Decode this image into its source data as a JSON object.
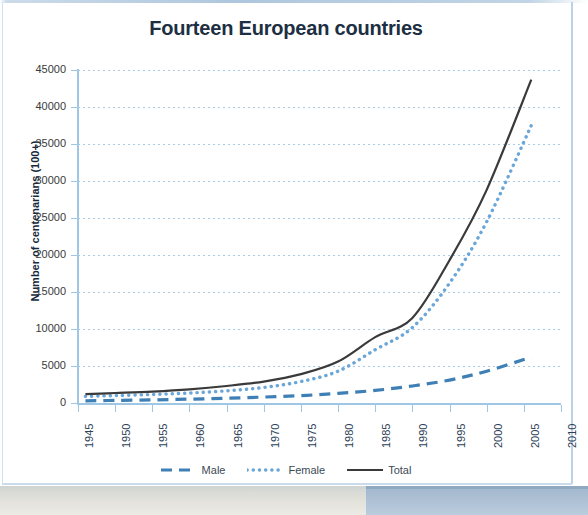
{
  "chart_title": "Fourteen European countries",
  "legend": {
    "items": [
      {
        "label": "Male",
        "key": "male",
        "style": "dashed",
        "color": "#3e7fb5"
      },
      {
        "label": "Female",
        "key": "female",
        "style": "dotted",
        "color": "#6aa6d8"
      },
      {
        "label": "Total",
        "key": "total",
        "style": "solid",
        "color": "#3a3a3a"
      }
    ]
  },
  "colors": {
    "title": "#1d2f42",
    "axis": "#9ec7e6",
    "gridline": "#a9cbe6",
    "male": "#3e7fb5",
    "female": "#6aa6d8",
    "total": "#3a3a3a",
    "page_background": "#ffffff",
    "strip_left": "#e3e2dc",
    "strip_right": "#aabfd4"
  },
  "chart_data": {
    "type": "line",
    "title": "Fourteen European countries",
    "xlabel": "",
    "ylabel": "Number of centenarians (100+)",
    "xlim": [
      1945,
      2010
    ],
    "ylim": [
      0,
      45000
    ],
    "xticks": [
      1945,
      1950,
      1955,
      1960,
      1965,
      1970,
      1975,
      1980,
      1985,
      1990,
      1995,
      2000,
      2005,
      2010
    ],
    "yticks": [
      0,
      5000,
      10000,
      15000,
      20000,
      25000,
      30000,
      35000,
      40000,
      45000
    ],
    "grid": "horizontal-dotted",
    "legend_position": "bottom",
    "x": [
      1946,
      1950,
      1955,
      1960,
      1965,
      1970,
      1975,
      1980,
      1985,
      1990,
      1995,
      2000,
      2006
    ],
    "series": [
      {
        "name": "Male",
        "style": "dashed",
        "color": "#3e7fb5",
        "values": [
          300,
          350,
          420,
          520,
          650,
          800,
          1000,
          1300,
          1700,
          2300,
          3100,
          4300,
          6200
        ]
      },
      {
        "name": "Female",
        "style": "dotted",
        "color": "#6aa6d8",
        "values": [
          900,
          1000,
          1150,
          1350,
          1650,
          2100,
          2900,
          4300,
          7200,
          10200,
          16200,
          24500,
          37500
        ]
      },
      {
        "name": "Total",
        "style": "solid",
        "color": "#3a3a3a",
        "values": [
          1200,
          1350,
          1550,
          1850,
          2300,
          2900,
          3900,
          5600,
          8900,
          11500,
          19300,
          28800,
          43700
        ]
      }
    ]
  }
}
